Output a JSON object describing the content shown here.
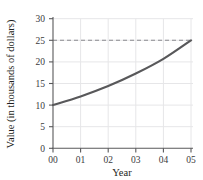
{
  "chart_data": {
    "type": "line",
    "title": "",
    "xlabel": "Year",
    "ylabel": "Value (in thousands of dollars)",
    "x": [
      "00",
      "01",
      "02",
      "03",
      "04",
      "05"
    ],
    "x_numeric": [
      0,
      1,
      2,
      3,
      4,
      5
    ],
    "values": [
      10,
      12,
      14.4,
      17.3,
      20.7,
      25
    ],
    "series": [
      {
        "name": "Value",
        "values": [
          10,
          12,
          14.4,
          17.3,
          20.7,
          25
        ],
        "color": "#58585a"
      }
    ],
    "xlim": [
      0,
      5
    ],
    "ylim": [
      0,
      30
    ],
    "yticks": [
      0,
      5,
      10,
      15,
      20,
      25,
      30
    ],
    "ytick_labels": [
      "0",
      "5",
      "10",
      "15",
      "20",
      "25",
      "30"
    ],
    "xticks": [
      0,
      1,
      2,
      3,
      4,
      5
    ],
    "xtick_labels": [
      "00",
      "01",
      "02",
      "03",
      "04",
      "05"
    ],
    "grid": true,
    "grid_color": "#e6e6e8",
    "legend": null,
    "annotations": [
      {
        "kind": "reference-line",
        "orientation": "horizontal",
        "value": 25,
        "style": "dashed",
        "color": "#8a8a8e"
      }
    ],
    "axis_color": "#58585a",
    "background": "#ffffff"
  }
}
